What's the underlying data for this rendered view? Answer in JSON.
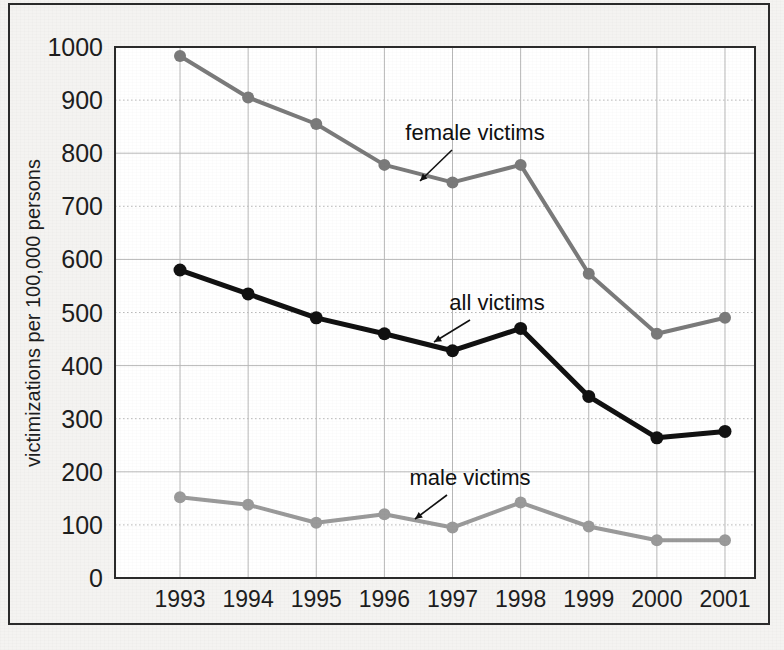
{
  "chart_data": {
    "type": "line",
    "title": "",
    "xlabel": "",
    "ylabel": "victimizations per 100,000 persons",
    "categories": [
      "1993",
      "1994",
      "1995",
      "1996",
      "1997",
      "1998",
      "1999",
      "2000",
      "2001"
    ],
    "ylim": [
      0,
      1000
    ],
    "yticks": [
      0,
      100,
      200,
      300,
      400,
      500,
      600,
      700,
      800,
      900,
      1000
    ],
    "ytick_labels": [
      "0",
      "100",
      "200",
      "300",
      "400",
      "500",
      "600",
      "700",
      "800",
      "900",
      "1000"
    ],
    "grid": true,
    "legend_position": "inline-annotations",
    "series": [
      {
        "name": "female victims",
        "color": "#7a7a7a",
        "values": [
          983,
          905,
          855,
          778,
          745,
          778,
          573,
          460,
          490
        ]
      },
      {
        "name": "all victims",
        "color": "#111111",
        "values": [
          580,
          535,
          490,
          460,
          428,
          470,
          342,
          264,
          276
        ]
      },
      {
        "name": "male victims",
        "color": "#9a9a9a",
        "values": [
          152,
          138,
          104,
          120,
          95,
          142,
          97,
          71,
          71
        ]
      }
    ],
    "annotations": [
      {
        "text": "female victims",
        "series": "female victims"
      },
      {
        "text": "all victims",
        "series": "all victims"
      },
      {
        "text": "male victims",
        "series": "male victims"
      }
    ]
  },
  "colors": {
    "background": "#f4f3f1",
    "frame": "#2b2b2b",
    "plot_background": "#ffffff",
    "axis": "#1d1d1d",
    "gridline": "#b9b9b9",
    "female": "#7a7a7a",
    "all": "#111111",
    "male": "#9a9a9a"
  }
}
